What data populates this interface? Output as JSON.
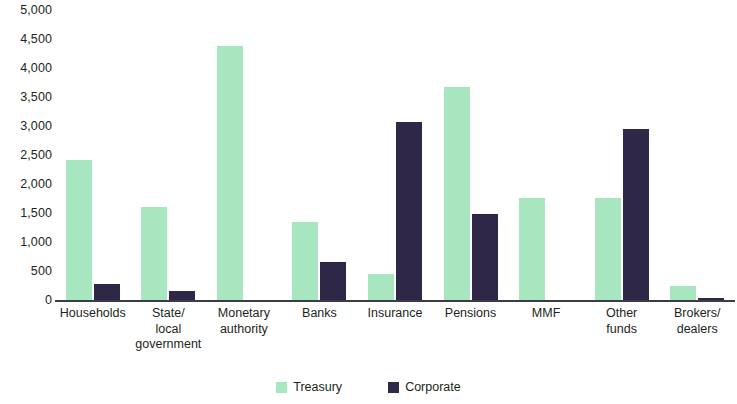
{
  "chart_data": {
    "type": "bar",
    "title": "",
    "subtitle": "",
    "xlabel": "",
    "ylabel": "",
    "ylim": [
      0,
      5000
    ],
    "ytick_step": 500,
    "grid": false,
    "legend_position": "bottom-center",
    "categories": [
      "Households",
      "State/\nlocal\ngovernment",
      "Monetary\nauthority",
      "Banks",
      "Insurance",
      "Pensions",
      "MMF",
      "Other\nfunds",
      "Brokers/\ndealers"
    ],
    "category_lines": [
      [
        "Households"
      ],
      [
        "State/",
        "local",
        "government"
      ],
      [
        "Monetary",
        "authority"
      ],
      [
        "Banks"
      ],
      [
        "Insurance"
      ],
      [
        "Pensions"
      ],
      [
        "MMF"
      ],
      [
        "Other",
        "funds"
      ],
      [
        "Brokers/",
        "dealers"
      ]
    ],
    "ytick_labels": [
      "0",
      "500",
      "1,000",
      "1,500",
      "2,000",
      "2,500",
      "3,000",
      "3,500",
      "4,000",
      "4,500",
      "5,000"
    ],
    "series": [
      {
        "name": "Treasury",
        "color": "#a8e6c0",
        "values": [
          2420,
          1600,
          4380,
          1340,
          440,
          3680,
          1760,
          1760,
          240
        ]
      },
      {
        "name": "Corporate",
        "color": "#2e2748",
        "values": [
          280,
          150,
          0,
          660,
          3070,
          1480,
          0,
          2940,
          40
        ]
      }
    ]
  },
  "legend": {
    "items": [
      {
        "label": "Treasury",
        "color": "#a8e6c0",
        "swatch_name": "legend-swatch-treasury"
      },
      {
        "label": "Corporate",
        "color": "#2e2748",
        "swatch_name": "legend-swatch-corporate"
      }
    ]
  }
}
